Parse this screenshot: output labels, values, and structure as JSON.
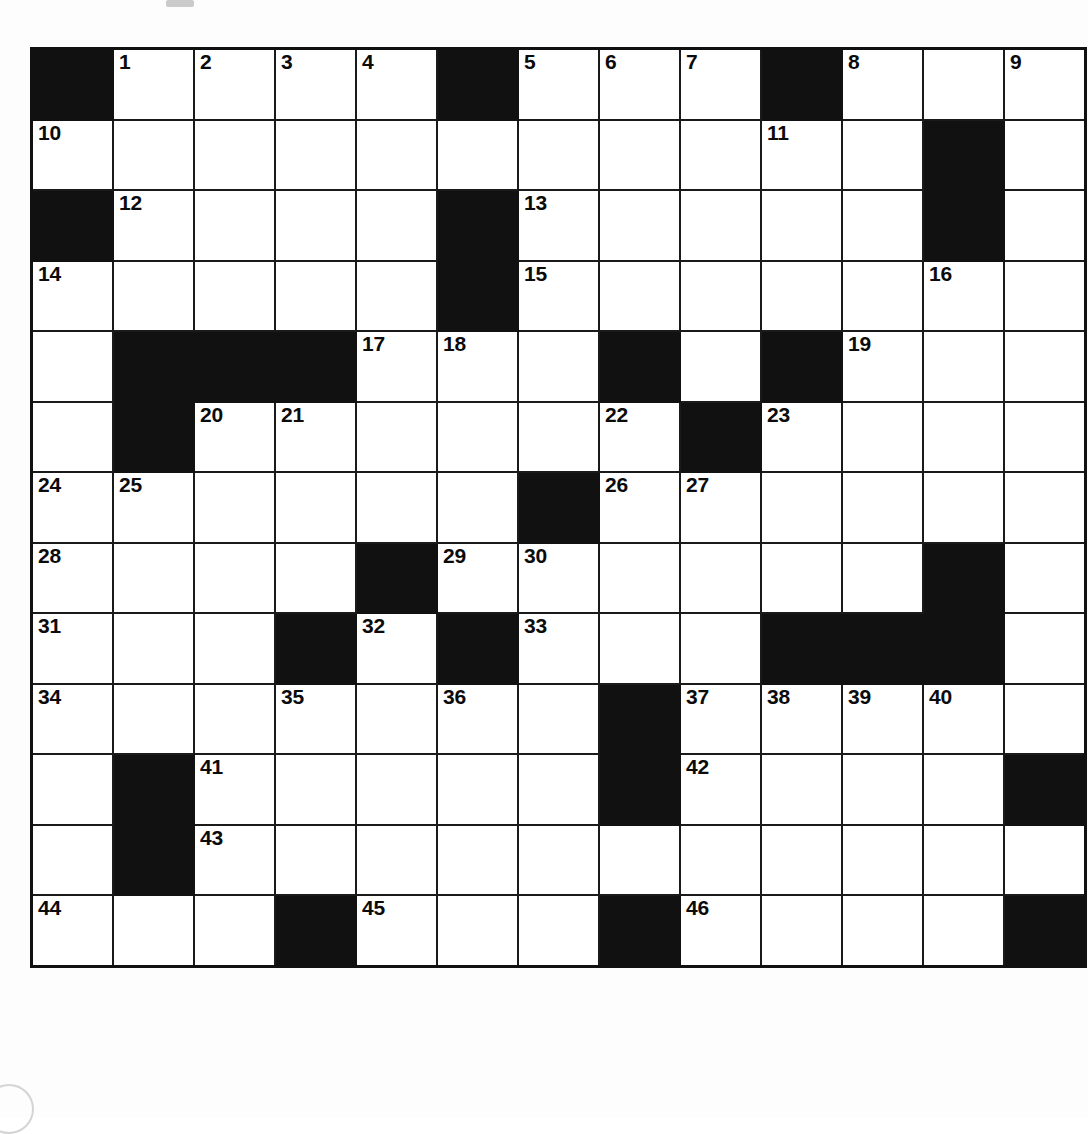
{
  "puzzle": {
    "type": "crossword-grid",
    "title": "",
    "rows": 15,
    "cols": 13,
    "colors": {
      "block": "#111111",
      "cell": "#ffffff",
      "grid_line": "#1a1a1a",
      "number": "#0b0b0b"
    },
    "max_clue_number": 46,
    "grid": [
      [
        {
          "block": true
        },
        {
          "num": "1"
        },
        {
          "num": "2"
        },
        {
          "num": "3"
        },
        {
          "num": "4"
        },
        {
          "block": true
        },
        {
          "num": "5"
        },
        {
          "num": "6"
        },
        {
          "num": "7"
        },
        {
          "block": true
        },
        {
          "num": "8"
        },
        {},
        {
          "num": "9"
        }
      ],
      [
        {
          "num": "10"
        },
        {},
        {},
        {},
        {},
        {},
        {},
        {},
        {},
        {
          "num": "11"
        },
        {},
        {
          "block": true
        },
        {}
      ],
      [
        {
          "block": true
        },
        {
          "num": "12"
        },
        {},
        {},
        {},
        {
          "block": true
        },
        {
          "num": "13"
        },
        {},
        {},
        {},
        {},
        {
          "block": true
        },
        {}
      ],
      [
        {
          "num": "14"
        },
        {},
        {},
        {},
        {},
        {
          "block": true
        },
        {
          "num": "15"
        },
        {},
        {},
        {},
        {},
        {
          "num": "16"
        },
        {}
      ],
      [
        {},
        {
          "block": true
        },
        {
          "block": true
        },
        {
          "block": true
        },
        {
          "num": "17"
        },
        {
          "num": "18"
        },
        {},
        {
          "block": true
        },
        {},
        {
          "block": true
        },
        {
          "num": "19"
        },
        {},
        {}
      ],
      [
        {},
        {
          "block": true
        },
        {
          "num": "20"
        },
        {
          "num": "21"
        },
        {},
        {},
        {},
        {
          "num": "22"
        },
        {
          "block": true
        },
        {
          "num": "23"
        },
        {},
        {},
        {}
      ],
      [
        {
          "num": "24"
        },
        {
          "num": "25"
        },
        {},
        {},
        {},
        {},
        {
          "block": true
        },
        {
          "num": "26"
        },
        {
          "num": "27"
        },
        {},
        {},
        {},
        {}
      ],
      [
        {
          "num": "28"
        },
        {},
        {},
        {},
        {
          "block": true
        },
        {
          "num": "29"
        },
        {
          "num": "30"
        },
        {},
        {},
        {},
        {},
        {
          "block": true
        },
        {}
      ],
      [
        {
          "num": "31"
        },
        {},
        {},
        {
          "block": true
        },
        {
          "num": "32"
        },
        {
          "block": true
        },
        {
          "num": "33"
        },
        {},
        {},
        {
          "block": true
        },
        {
          "block": true
        },
        {
          "block": true
        },
        {}
      ],
      [
        {
          "num": "34"
        },
        {},
        {},
        {
          "num": "35"
        },
        {},
        {
          "num": "36"
        },
        {},
        {
          "block": true
        },
        {
          "num": "37"
        },
        {
          "num": "38"
        },
        {
          "num": "39"
        },
        {
          "num": "40"
        },
        {}
      ],
      [
        {},
        {
          "block": true
        },
        {
          "num": "41"
        },
        {},
        {},
        {},
        {},
        {
          "block": true
        },
        {
          "num": "42"
        },
        {},
        {},
        {},
        {
          "block": true
        }
      ],
      [
        {},
        {
          "block": true
        },
        {
          "num": "43"
        },
        {},
        {},
        {},
        {},
        {},
        {},
        {},
        {},
        {},
        {}
      ],
      [
        {
          "num": "44"
        },
        {},
        {},
        {
          "block": true
        },
        {
          "num": "45"
        },
        {},
        {},
        {
          "block": true
        },
        {
          "num": "46"
        },
        {},
        {},
        {},
        {
          "block": true
        }
      ]
    ]
  }
}
